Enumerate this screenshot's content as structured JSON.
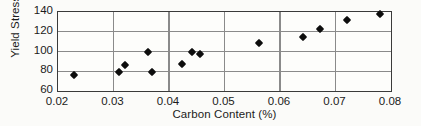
{
  "chart_data": {
    "type": "scatter",
    "title": "",
    "xlabel": "Carbon Content (%)",
    "ylabel": "Yield Stress (ksi)",
    "xlim": [
      0.02,
      0.08
    ],
    "ylim": [
      60,
      140
    ],
    "xticks": [
      "0.02",
      "0.03",
      "0.04",
      "0.05",
      "0.06",
      "0.07",
      "0.08"
    ],
    "xtick_values": [
      0.02,
      0.03,
      0.04,
      0.05,
      0.06,
      0.07,
      0.08
    ],
    "yticks": [
      "140",
      "120",
      "100",
      "80",
      "60"
    ],
    "ytick_values": [
      140,
      120,
      100,
      80,
      60
    ],
    "grid": true,
    "grid_x_values": [
      0.03,
      0.04,
      0.05,
      0.06,
      0.07
    ],
    "grid_y_values": [
      80,
      100,
      120
    ],
    "legend": null,
    "marker": "diamond",
    "marker_color": "#0d0d0d",
    "points": [
      {
        "x": 0.0228,
        "y": 76
      },
      {
        "x": 0.031,
        "y": 79
      },
      {
        "x": 0.032,
        "y": 86.5
      },
      {
        "x": 0.0362,
        "y": 99
      },
      {
        "x": 0.037,
        "y": 79.5
      },
      {
        "x": 0.0424,
        "y": 87
      },
      {
        "x": 0.0441,
        "y": 100
      },
      {
        "x": 0.0455,
        "y": 97
      },
      {
        "x": 0.0563,
        "y": 109
      },
      {
        "x": 0.0642,
        "y": 115
      },
      {
        "x": 0.0672,
        "y": 122.5
      },
      {
        "x": 0.0721,
        "y": 131.5
      },
      {
        "x": 0.078,
        "y": 137.5
      }
    ]
  }
}
